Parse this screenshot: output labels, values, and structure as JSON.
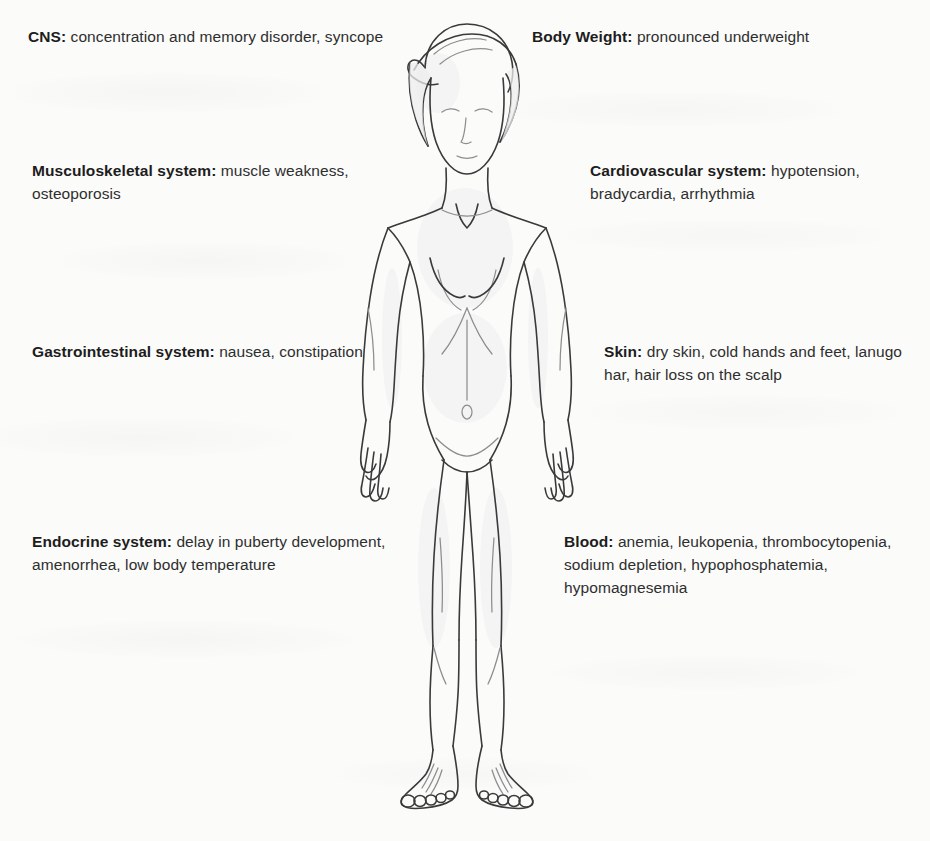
{
  "figure": {
    "alt_name": "anorexia-nervosa-body-diagram",
    "line_color": "#3a3a3a",
    "background_color": "#fbfbfa",
    "text_color": "#2e2e2e"
  },
  "labels": {
    "left": [
      {
        "id": "cns",
        "term": "CNS:",
        "text": " concentration and memory disorder, syncope"
      },
      {
        "id": "musculoskeletal",
        "term": "Musculoskeletal system:",
        "text": " muscle weakness, osteoporosis"
      },
      {
        "id": "gastrointestinal",
        "term": "Gastrointestinal system:",
        "text": " nausea, constipation"
      },
      {
        "id": "endocrine",
        "term": "Endocrine system:",
        "text": " delay in puberty development, amenorrhea, low body temperature"
      }
    ],
    "right": [
      {
        "id": "body-weight",
        "term": "Body Weight:",
        "text": " pronounced underweight"
      },
      {
        "id": "cardiovascular",
        "term": "Cardiovascular system:",
        "text": " hypotension, bradycardia, arrhythmia"
      },
      {
        "id": "skin",
        "term": "Skin:",
        "text": " dry skin, cold hands and feet, lanugo har, hair loss on the scalp"
      },
      {
        "id": "blood",
        "term": "Blood:",
        "text": " anemia, leukopenia, thrombocytopenia, sodium depletion, hypophosphatemia, hypomagnesemia"
      }
    ]
  }
}
